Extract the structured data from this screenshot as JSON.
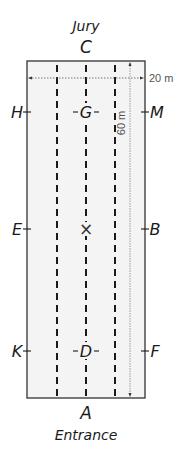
{
  "diagram": {
    "colors": {
      "arena_fill": "#f4f4f4",
      "arena_border": "#333333",
      "track_lines": "#1a1a1a",
      "dimension_lines": "#777777",
      "text": "#1a1a1a"
    },
    "top_label": "Jury",
    "bottom_label": "Entrance",
    "dimensions": {
      "width": "20 m",
      "length": "60 m"
    },
    "letters": {
      "top": "C",
      "bottom": "A",
      "left": [
        "H",
        "E",
        "K"
      ],
      "right": [
        "M",
        "B",
        "F"
      ],
      "center_line": [
        "G",
        "X",
        "D"
      ]
    },
    "center_marker": "×"
  }
}
